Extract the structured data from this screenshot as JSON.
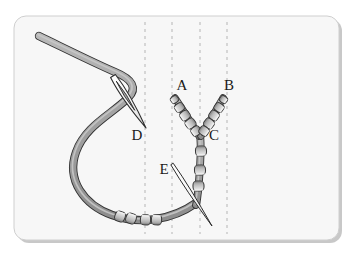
{
  "figure": {
    "kind": "instructional-needlework-illustration",
    "canvas": {
      "width": 353,
      "height": 255
    },
    "background_color": "#ffffff"
  },
  "card": {
    "name": "diagram-card",
    "x": 14,
    "y": 16,
    "width": 325,
    "height": 224,
    "corner_radius": 12,
    "fill_color": "#f7f7f7",
    "border_color": "#cfcfcf",
    "shadow_color": "#9a9a9a"
  },
  "guides": {
    "label": "fabric alignment guide lines",
    "style": "dashed-vertical",
    "color": "#bcbcbc",
    "dash": "3 4",
    "stroke_width": 1.1,
    "top_y": 22,
    "bottom_y": 234,
    "x_positions": [
      145,
      172,
      200,
      227
    ]
  },
  "palette": {
    "thread_fill": "#9d9d9d",
    "thread_highlight": "#c9c9c9",
    "thread_outline": "#333333",
    "bead_fill": "#cfcfcf",
    "bead_highlight": "#f2f2f2",
    "bead_shadow": "#8e8e8e",
    "bead_outline": "#3a3a3a",
    "needle_fill": "#fbfbfb",
    "needle_outline": "#2b2b2b",
    "label_color": "#1a1a1a"
  },
  "labels": [
    {
      "id": "A",
      "text": "A",
      "x": 182,
      "y": 90,
      "note": "tip of left beaded arm"
    },
    {
      "id": "B",
      "text": "B",
      "x": 229,
      "y": 90,
      "note": "tip of right beaded arm"
    },
    {
      "id": "C",
      "text": "C",
      "x": 214,
      "y": 140,
      "note": "junction where the two arms meet"
    },
    {
      "id": "D",
      "text": "D",
      "x": 137,
      "y": 140,
      "note": "needle eye with working thread"
    },
    {
      "id": "E",
      "text": "E",
      "x": 164,
      "y": 174,
      "note": "second needle entering fabric"
    }
  ],
  "threads": [
    {
      "name": "working-thread",
      "description": "Long gray working thread entering from upper left, passing through needle eye D, sweeping down and around to the lower right where it carries beads.",
      "stroke_width": 6.5,
      "path": "M 39 36 C 60 46, 92 62, 115 72 C 132 79, 138 88, 128 98 C 112 114, 85 126, 76 152 C 66 180, 84 205, 112 215 C 140 225, 172 220, 196 203"
    },
    {
      "name": "stem-thread-below-C",
      "description": "Vertical thread segment running down from junction C through three beads to the lower curve.",
      "stroke_width": 6.0,
      "path": "M 200 135 C 202 150, 200 170, 198 192 C 197 199, 197 202, 196 205"
    },
    {
      "name": "left-arm-thread",
      "description": "Thread of the left beaded arm from junction C up to tip A.",
      "stroke_width": 5.6,
      "path": "M 199 136 C 192 124, 183 110, 175 98"
    },
    {
      "name": "right-arm-thread",
      "description": "Thread of the right beaded arm from junction C up to tip B.",
      "stroke_width": 5.6,
      "path": "M 201 136 C 208 124, 216 110, 223 98"
    }
  ],
  "bead_groups": [
    {
      "name": "left-arm-beads",
      "count": 5,
      "angle_deg": -125,
      "beads": [
        {
          "cx": 174.5,
          "cy": 99.5,
          "w": 7.0,
          "h": 7.5
        },
        {
          "cx": 179.5,
          "cy": 107.5,
          "w": 8.6,
          "h": 9.2
        },
        {
          "cx": 185.0,
          "cy": 115.5,
          "w": 9.2,
          "h": 9.6
        },
        {
          "cx": 190.5,
          "cy": 123.5,
          "w": 9.4,
          "h": 9.8
        },
        {
          "cx": 196.0,
          "cy": 131.0,
          "w": 9.0,
          "h": 9.4
        }
      ]
    },
    {
      "name": "right-arm-beads",
      "count": 5,
      "angle_deg": 125,
      "beads": [
        {
          "cx": 223.5,
          "cy": 99.5,
          "w": 7.0,
          "h": 7.5
        },
        {
          "cx": 219.0,
          "cy": 107.5,
          "w": 8.6,
          "h": 9.2
        },
        {
          "cx": 214.0,
          "cy": 115.5,
          "w": 9.2,
          "h": 9.6
        },
        {
          "cx": 209.0,
          "cy": 123.5,
          "w": 9.4,
          "h": 9.8
        },
        {
          "cx": 204.0,
          "cy": 131.0,
          "w": 9.0,
          "h": 9.4
        }
      ]
    },
    {
      "name": "stem-beads",
      "count": 3,
      "angle_deg": 178,
      "beads": [
        {
          "cx": 201.0,
          "cy": 151.0,
          "w": 11.0,
          "h": 10.0
        },
        {
          "cx": 200.0,
          "cy": 170.0,
          "w": 11.0,
          "h": 10.0
        },
        {
          "cx": 198.5,
          "cy": 186.0,
          "w": 11.0,
          "h": 10.0
        }
      ]
    },
    {
      "name": "lower-left-bead-pair",
      "count": 2,
      "angle_deg": 20,
      "beads": [
        {
          "cx": 120.0,
          "cy": 216.5,
          "w": 10.2,
          "h": 10.0
        },
        {
          "cx": 131.0,
          "cy": 218.5,
          "w": 10.2,
          "h": 10.0
        }
      ]
    },
    {
      "name": "lower-right-bead-pair",
      "count": 2,
      "angle_deg": 3,
      "beads": [
        {
          "cx": 145.5,
          "cy": 219.8,
          "w": 10.2,
          "h": 10.0
        },
        {
          "cx": 156.5,
          "cy": 219.8,
          "w": 10.2,
          "h": 10.0
        }
      ]
    }
  ],
  "needles": [
    {
      "name": "needle-D",
      "label_ref": "D",
      "description": "Threading needle whose long eye holds the working thread; points down-right toward label D.",
      "tip_x": 146,
      "tip_y": 128,
      "tail_x": 113,
      "tail_y": 76,
      "half_width": 5.2,
      "eye": {
        "length": 34,
        "width": 2.3
      }
    },
    {
      "name": "needle-E",
      "label_ref": "E",
      "description": "Straight sewing needle angled down-right, point at lower right, entering near label E.",
      "tail_x": 172,
      "tail_y": 164,
      "tip_x": 212,
      "tip_y": 226,
      "half_width": 2.6
    }
  ]
}
